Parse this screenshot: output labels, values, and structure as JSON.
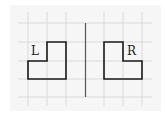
{
  "diagram": {
    "labels": {
      "left": "L",
      "right": "R"
    },
    "colors": {
      "background": "#f6f6f6",
      "grid": "#d4d4d4",
      "axis": "#555555",
      "shape": "#1a1a1a"
    }
  }
}
